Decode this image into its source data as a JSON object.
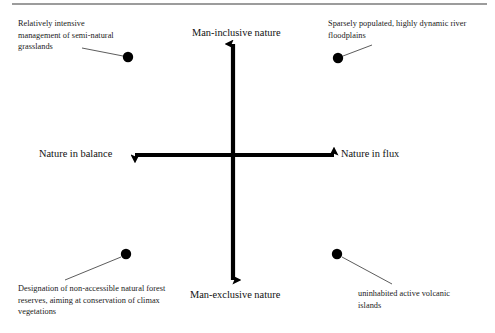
{
  "figure": {
    "kind": "quadrant-diagram",
    "width": 495,
    "height": 333,
    "background_color": "#ffffff",
    "ink_color": "#000000",
    "top_rule": {
      "name": "top-horizontal-rule",
      "x1": 12,
      "x2": 487,
      "y": 4,
      "thickness": 1.2,
      "color": "#3b3b3b"
    },
    "axes": {
      "origin_x": 233,
      "origin_y": 155,
      "line_thickness": 4.2,
      "color": "#000000",
      "vertical": {
        "top_y": 44,
        "bottom_y": 280
      },
      "horizontal": {
        "left_x": 135,
        "right_x": 334
      },
      "labels": {
        "top": "Man-inclusive nature",
        "bottom": "Man-exclusive nature",
        "left": "Nature in balance",
        "right": "Nature in flux"
      }
    },
    "callouts": [
      {
        "id": "upper-left",
        "text": "Relatively intensive\nmanagement of semi-natural\ngrasslands",
        "dot": {
          "cx": 128,
          "cy": 57,
          "r": 5.2
        },
        "leader": {
          "x1": 82,
          "y1": 48,
          "x2": 123,
          "y2": 56
        }
      },
      {
        "id": "upper-right",
        "text": "Sparsely populated, highly dynamic river\nfloodplains",
        "dot": {
          "cx": 338,
          "cy": 58,
          "r": 5.2
        },
        "leader": {
          "x1": 343,
          "y1": 56,
          "x2": 372,
          "y2": 45
        }
      },
      {
        "id": "lower-left",
        "text": "Designation of non-accessible natural forest\nreserves, aiming at conservation of climax\nvegetations",
        "dot": {
          "cx": 126,
          "cy": 254,
          "r": 5.2
        },
        "leader": {
          "x1": 65,
          "y1": 280,
          "x2": 121,
          "y2": 257
        }
      },
      {
        "id": "lower-right",
        "text": "uninhabited active volcanic\nislands",
        "dot": {
          "cx": 337,
          "cy": 254,
          "r": 5.2
        },
        "leader": {
          "x1": 342,
          "y1": 257,
          "x2": 392,
          "y2": 284
        }
      }
    ]
  }
}
